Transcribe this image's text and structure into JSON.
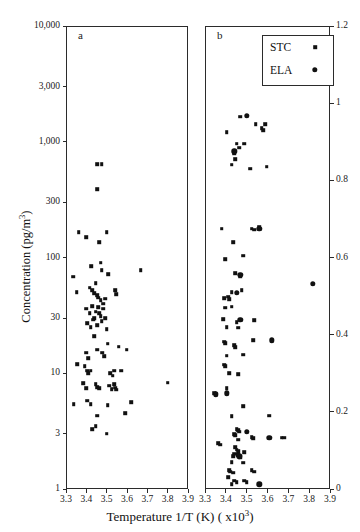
{
  "chart_data": {
    "type": "scatter",
    "title": "",
    "xlabel": "Temperature 1/T (K) ( x10³)",
    "ylabel": "Concentration (pg/m³)",
    "grid": false,
    "legend_position": "top-right",
    "legend": [
      {
        "name": "STC",
        "marker": "square"
      },
      {
        "name": "ELA",
        "marker": "circle"
      }
    ],
    "panels": [
      {
        "id": "a",
        "letter": "a",
        "xlim": [
          3.3,
          3.9
        ],
        "xticks": [
          3.3,
          3.4,
          3.5,
          3.6,
          3.7,
          3.8,
          3.9
        ],
        "xticklabels": [
          "3.3",
          "3.4",
          "3.5",
          "3.6",
          "3.7",
          "3.8",
          "3.9"
        ],
        "yscale": "log",
        "ylim": [
          1,
          10000
        ],
        "yticks": [
          1,
          3,
          10,
          30,
          100,
          300,
          1000,
          3000,
          10000
        ],
        "yticklabels": [
          "1",
          "3",
          "10",
          "30",
          "100",
          "300",
          "1,000",
          "3,000",
          "10,000"
        ],
        "yaxis_side": "left",
        "series": [
          {
            "name": "STC",
            "marker": "square",
            "points": [
              [
                3.452,
                640
              ],
              [
                3.476,
                640
              ],
              [
                3.452,
                390
              ],
              [
                3.362,
                165
              ],
              [
                3.398,
                150
              ],
              [
                3.464,
                135
              ],
              [
                3.5,
                165
              ],
              [
                3.336,
                68
              ],
              [
                3.424,
                84
              ],
              [
                3.47,
                90
              ],
              [
                3.476,
                78
              ],
              [
                3.508,
                72
              ],
              [
                3.668,
                78
              ],
              [
                3.352,
                50
              ],
              [
                3.416,
                55
              ],
              [
                3.43,
                52
              ],
              [
                3.44,
                49
              ],
              [
                3.446,
                60
              ],
              [
                3.452,
                47
              ],
              [
                3.458,
                45
              ],
              [
                3.47,
                43
              ],
              [
                3.482,
                40
              ],
              [
                3.494,
                44
              ],
              [
                3.542,
                52
              ],
              [
                3.548,
                48
              ],
              [
                3.398,
                36
              ],
              [
                3.416,
                33
              ],
              [
                3.428,
                38
              ],
              [
                3.44,
                30
              ],
              [
                3.446,
                34
              ],
              [
                3.458,
                37
              ],
              [
                3.464,
                33
              ],
              [
                3.47,
                31
              ],
              [
                3.482,
                36
              ],
              [
                3.494,
                30
              ],
              [
                3.404,
                27
              ],
              [
                3.422,
                25
              ],
              [
                3.434,
                29
              ],
              [
                3.452,
                26
              ],
              [
                3.476,
                28
              ],
              [
                3.5,
                24
              ],
              [
                3.44,
                21
              ],
              [
                3.506,
                18
              ],
              [
                3.56,
                17
              ],
              [
                3.398,
                15
              ],
              [
                3.41,
                13.5
              ],
              [
                3.452,
                16
              ],
              [
                3.478,
                15
              ],
              [
                3.488,
                14
              ],
              [
                3.598,
                16
              ],
              [
                3.356,
                12
              ],
              [
                3.392,
                11.5
              ],
              [
                3.404,
                10.5
              ],
              [
                3.41,
                10
              ],
              [
                3.422,
                10.5
              ],
              [
                3.518,
                10
              ],
              [
                3.53,
                9.5
              ],
              [
                3.536,
                10.5
              ],
              [
                3.572,
                10.5
              ],
              [
                3.386,
                8.2
              ],
              [
                3.398,
                7.4
              ],
              [
                3.446,
                8.0
              ],
              [
                3.452,
                7.6
              ],
              [
                3.464,
                7.4
              ],
              [
                3.512,
                7.8
              ],
              [
                3.524,
                7.3
              ],
              [
                3.536,
                8.0
              ],
              [
                3.542,
                7.5
              ],
              [
                3.548,
                7.2
              ],
              [
                3.8,
                8.3
              ],
              [
                3.338,
                5.4
              ],
              [
                3.404,
                5.8
              ],
              [
                3.422,
                5.4
              ],
              [
                3.506,
                5.3
              ],
              [
                3.62,
                5.6
              ],
              [
                3.452,
                4.3
              ],
              [
                3.59,
                4.5
              ],
              [
                3.428,
                3.3
              ],
              [
                3.446,
                3.5
              ],
              [
                3.5,
                3.0
              ]
            ]
          }
        ]
      },
      {
        "id": "b",
        "letter": "b",
        "xlim": [
          3.3,
          3.9
        ],
        "xticks": [
          3.3,
          3.4,
          3.5,
          3.6,
          3.7,
          3.8,
          3.9
        ],
        "xticklabels": [
          "3.3",
          "3.4",
          "3.5",
          "3.6",
          "3.7",
          "3.8",
          "3.9"
        ],
        "yscale": "linear",
        "ylim": [
          0,
          1.2
        ],
        "yticks": [
          0,
          0.2,
          0.4,
          0.6,
          0.8,
          1,
          1.2
        ],
        "yticklabels": [
          "0",
          "0.2",
          "0.4",
          "0.6",
          "0.8",
          "1",
          "1.2"
        ],
        "yaxis_side": "right",
        "series": [
          {
            "name": "STC",
            "marker": "square",
            "points": [
              [
                3.47,
                0.965
              ],
              [
                3.544,
                0.945
              ],
              [
                3.572,
                0.935
              ],
              [
                3.578,
                0.93
              ],
              [
                3.59,
                0.945
              ],
              [
                3.404,
                0.925
              ],
              [
                3.452,
                0.895
              ],
              [
                3.464,
                0.885
              ],
              [
                3.488,
                0.895
              ],
              [
                3.44,
                0.87
              ],
              [
                3.446,
                0.855
              ],
              [
                3.428,
                0.84
              ],
              [
                3.518,
                0.83
              ],
              [
                3.596,
                0.835
              ],
              [
                3.38,
                0.675
              ],
              [
                3.524,
                0.675
              ],
              [
                3.536,
                0.672
              ],
              [
                3.56,
                0.678
              ],
              [
                3.434,
                0.64
              ],
              [
                3.398,
                0.595
              ],
              [
                3.482,
                0.605
              ],
              [
                3.446,
                0.56
              ],
              [
                3.47,
                0.55
              ],
              [
                3.428,
                0.51
              ],
              [
                3.476,
                0.515
              ],
              [
                3.392,
                0.495
              ],
              [
                3.41,
                0.498
              ],
              [
                3.416,
                0.492
              ],
              [
                3.398,
                0.47
              ],
              [
                3.428,
                0.472
              ],
              [
                3.386,
                0.44
              ],
              [
                3.452,
                0.432
              ],
              [
                3.536,
                0.438
              ],
              [
                3.404,
                0.42
              ],
              [
                3.458,
                0.418
              ],
              [
                3.392,
                0.382
              ],
              [
                3.398,
                0.378
              ],
              [
                3.44,
                0.372
              ],
              [
                3.446,
                0.368
              ],
              [
                3.53,
                0.385
              ],
              [
                3.404,
                0.345
              ],
              [
                3.482,
                0.348
              ],
              [
                3.392,
                0.322
              ],
              [
                3.398,
                0.318
              ],
              [
                3.416,
                0.3
              ],
              [
                3.458,
                0.298
              ],
              [
                3.344,
                0.248
              ],
              [
                3.352,
                0.245
              ],
              [
                3.404,
                0.262
              ],
              [
                3.482,
                0.215
              ],
              [
                3.428,
                0.188
              ],
              [
                3.608,
                0.19
              ],
              [
                3.452,
                0.155
              ],
              [
                3.458,
                0.152
              ],
              [
                3.464,
                0.148
              ],
              [
                3.44,
                0.142
              ],
              [
                3.446,
                0.14
              ],
              [
                3.458,
                0.128
              ],
              [
                3.524,
                0.135
              ],
              [
                3.53,
                0.132
              ],
              [
                3.668,
                0.133
              ],
              [
                3.68,
                0.133
              ],
              [
                3.362,
                0.118
              ],
              [
                3.374,
                0.115
              ],
              [
                3.446,
                0.108
              ],
              [
                3.452,
                0.102
              ],
              [
                3.458,
                0.098
              ],
              [
                3.44,
                0.092
              ],
              [
                3.488,
                0.095
              ],
              [
                3.434,
                0.085
              ],
              [
                3.47,
                0.082
              ],
              [
                3.428,
                0.07
              ],
              [
                3.482,
                0.068
              ],
              [
                3.416,
                0.048
              ],
              [
                3.422,
                0.045
              ],
              [
                3.434,
                0.042
              ],
              [
                3.524,
                0.048
              ],
              [
                3.536,
                0.045
              ],
              [
                3.41,
                0.03
              ],
              [
                3.44,
                0.022
              ],
              [
                3.452,
                0.018
              ],
              [
                3.488,
                0.022
              ],
              [
                3.5,
                0.018
              ],
              [
                3.428,
                0.012
              ]
            ]
          },
          {
            "name": "ELA",
            "marker": "circle",
            "points": [
              [
                3.5,
                0.968
              ],
              [
                3.44,
                0.875
              ],
              [
                3.56,
                0.675
              ],
              [
                3.47,
                0.555
              ],
              [
                3.452,
                0.508
              ],
              [
                3.818,
                0.532
              ],
              [
                3.47,
                0.438
              ],
              [
                3.62,
                0.385
              ],
              [
                3.404,
                0.248
              ],
              [
                3.352,
                0.245
              ],
              [
                3.5,
                0.148
              ],
              [
                3.608,
                0.132
              ],
              [
                3.458,
                0.088
              ],
              [
                3.464,
                0.085
              ],
              [
                3.56,
                0.012
              ]
            ]
          }
        ]
      }
    ]
  }
}
